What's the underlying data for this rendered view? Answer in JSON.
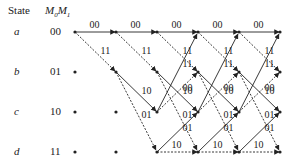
{
  "header": {
    "state_label": "State",
    "bits_label": "M0M1"
  },
  "states": [
    {
      "name": "a",
      "bits": "00"
    },
    {
      "name": "b",
      "bits": "01"
    },
    {
      "name": "c",
      "bits": "10"
    },
    {
      "name": "d",
      "bits": "11"
    }
  ],
  "legend": {
    "solid": "input 0",
    "dashed": "input 1"
  },
  "transitions": [
    {
      "from": "a",
      "to": "a",
      "output": "00",
      "style": "solid"
    },
    {
      "from": "a",
      "to": "b",
      "output": "11",
      "style": "dashed"
    },
    {
      "from": "b",
      "to": "c",
      "output": "10",
      "style": "solid"
    },
    {
      "from": "b",
      "to": "d",
      "output": "01",
      "style": "dashed"
    },
    {
      "from": "c",
      "to": "a",
      "output": "11",
      "style": "solid"
    },
    {
      "from": "c",
      "to": "b",
      "output": "00",
      "style": "dashed"
    },
    {
      "from": "d",
      "to": "c",
      "output": "01",
      "style": "solid"
    },
    {
      "from": "d",
      "to": "d",
      "output": "10",
      "style": "dashed"
    }
  ],
  "stages": 5
}
